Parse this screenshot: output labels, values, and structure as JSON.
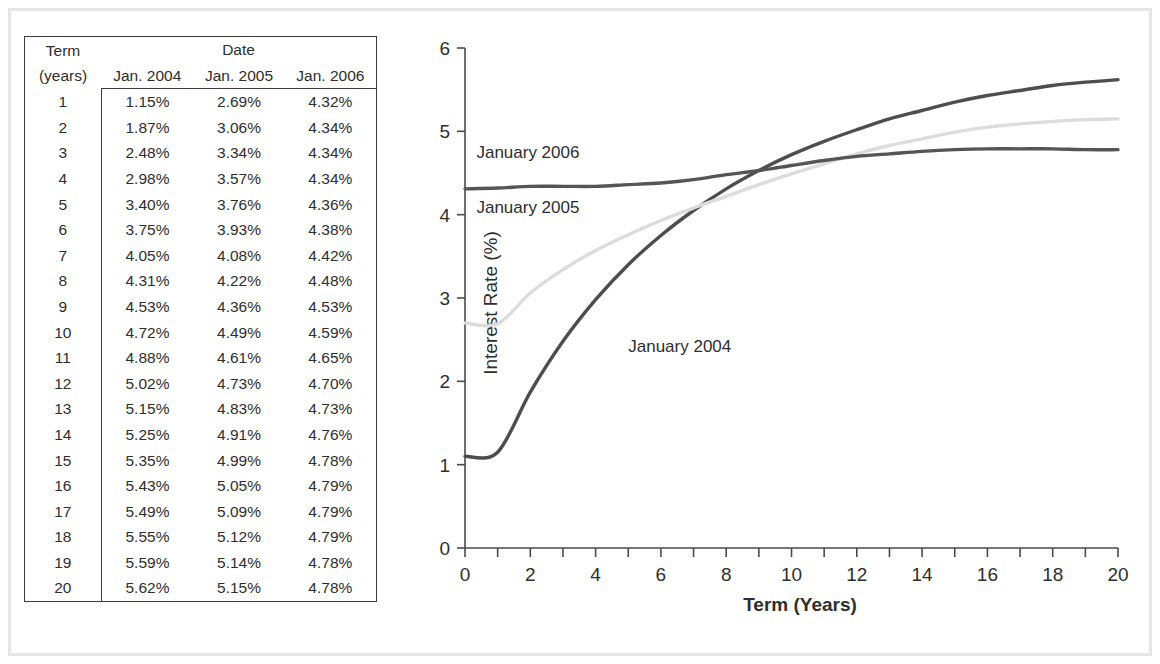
{
  "table": {
    "corner_header": {
      "line1": "Term",
      "line2": "(years)"
    },
    "group_header": "Date",
    "columns": [
      "Jan. 2004",
      "Jan. 2005",
      "Jan. 2006"
    ],
    "rows": [
      {
        "term": "1",
        "v2004": "1.15%",
        "v2005": "2.69%",
        "v2006": "4.32%"
      },
      {
        "term": "2",
        "v2004": "1.87%",
        "v2005": "3.06%",
        "v2006": "4.34%"
      },
      {
        "term": "3",
        "v2004": "2.48%",
        "v2005": "3.34%",
        "v2006": "4.34%"
      },
      {
        "term": "4",
        "v2004": "2.98%",
        "v2005": "3.57%",
        "v2006": "4.34%"
      },
      {
        "term": "5",
        "v2004": "3.40%",
        "v2005": "3.76%",
        "v2006": "4.36%"
      },
      {
        "term": "6",
        "v2004": "3.75%",
        "v2005": "3.93%",
        "v2006": "4.38%"
      },
      {
        "term": "7",
        "v2004": "4.05%",
        "v2005": "4.08%",
        "v2006": "4.42%"
      },
      {
        "term": "8",
        "v2004": "4.31%",
        "v2005": "4.22%",
        "v2006": "4.48%"
      },
      {
        "term": "9",
        "v2004": "4.53%",
        "v2005": "4.36%",
        "v2006": "4.53%"
      },
      {
        "term": "10",
        "v2004": "4.72%",
        "v2005": "4.49%",
        "v2006": "4.59%"
      },
      {
        "term": "11",
        "v2004": "4.88%",
        "v2005": "4.61%",
        "v2006": "4.65%"
      },
      {
        "term": "12",
        "v2004": "5.02%",
        "v2005": "4.73%",
        "v2006": "4.70%"
      },
      {
        "term": "13",
        "v2004": "5.15%",
        "v2005": "4.83%",
        "v2006": "4.73%"
      },
      {
        "term": "14",
        "v2004": "5.25%",
        "v2005": "4.91%",
        "v2006": "4.76%"
      },
      {
        "term": "15",
        "v2004": "5.35%",
        "v2005": "4.99%",
        "v2006": "4.78%"
      },
      {
        "term": "16",
        "v2004": "5.43%",
        "v2005": "5.05%",
        "v2006": "4.79%"
      },
      {
        "term": "17",
        "v2004": "5.49%",
        "v2005": "5.09%",
        "v2006": "4.79%"
      },
      {
        "term": "18",
        "v2004": "5.55%",
        "v2005": "5.12%",
        "v2006": "4.79%"
      },
      {
        "term": "19",
        "v2004": "5.59%",
        "v2005": "5.14%",
        "v2006": "4.78%"
      },
      {
        "term": "20",
        "v2004": "5.62%",
        "v2005": "5.15%",
        "v2006": "4.78%"
      }
    ]
  },
  "chart_data": {
    "type": "line",
    "title": "",
    "xlabel": "Term (Years)",
    "ylabel": "Interest Rate (%)",
    "xlim": [
      0,
      20
    ],
    "ylim": [
      0,
      6
    ],
    "xticks": [
      0,
      1,
      2,
      3,
      4,
      5,
      6,
      7,
      8,
      9,
      10,
      11,
      12,
      13,
      14,
      15,
      16,
      17,
      18,
      19,
      20
    ],
    "xtick_labels": [
      "0",
      "",
      "2",
      "",
      "4",
      "",
      "6",
      "",
      "8",
      "",
      "10",
      "",
      "12",
      "",
      "14",
      "",
      "16",
      "",
      "18",
      "",
      "20"
    ],
    "yticks": [
      0,
      1,
      2,
      3,
      4,
      5,
      6
    ],
    "ytick_labels": [
      "0",
      "1",
      "2",
      "3",
      "4",
      "5",
      "6"
    ],
    "grid": false,
    "legend_position": "inline-annotations",
    "x": [
      0,
      1,
      2,
      3,
      4,
      5,
      6,
      7,
      8,
      9,
      10,
      11,
      12,
      13,
      14,
      15,
      16,
      17,
      18,
      19,
      20
    ],
    "series": [
      {
        "name": "January 2004",
        "color": "#4d4d4d",
        "label_x": 5.0,
        "label_y": 2.35,
        "values": [
          1.1,
          1.15,
          1.87,
          2.48,
          2.98,
          3.4,
          3.75,
          4.05,
          4.31,
          4.53,
          4.72,
          4.88,
          5.02,
          5.15,
          5.25,
          5.35,
          5.43,
          5.49,
          5.55,
          5.59,
          5.62
        ]
      },
      {
        "name": "January 2005",
        "color": "#dcdcdc",
        "label_x": 0.35,
        "label_y": 4.02,
        "values": [
          2.7,
          2.69,
          3.06,
          3.34,
          3.57,
          3.76,
          3.93,
          4.08,
          4.22,
          4.36,
          4.49,
          4.61,
          4.73,
          4.83,
          4.91,
          4.99,
          5.05,
          5.09,
          5.12,
          5.14,
          5.15
        ]
      },
      {
        "name": "January 2006",
        "color": "#555555",
        "label_x": 0.35,
        "label_y": 4.68,
        "values": [
          4.31,
          4.32,
          4.34,
          4.34,
          4.34,
          4.36,
          4.38,
          4.42,
          4.48,
          4.53,
          4.59,
          4.65,
          4.7,
          4.73,
          4.76,
          4.78,
          4.79,
          4.79,
          4.79,
          4.78,
          4.78
        ]
      }
    ]
  },
  "colors": {
    "axis": "#4a4a4a",
    "text": "#2e2e2e",
    "frame": "#e6e6e6",
    "table_border": "#3c3c3c",
    "muted_text": "#c9c9c9"
  }
}
